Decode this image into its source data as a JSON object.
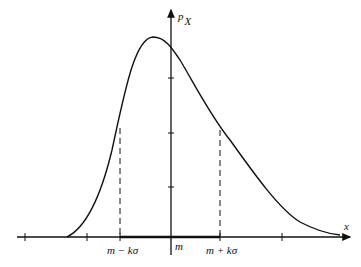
{
  "diagram": {
    "type": "probability-density",
    "y_axis": {
      "label": "p",
      "subscript": "X"
    },
    "x_axis": {
      "label": "x"
    },
    "mean_label": "m",
    "left_bound_label": "m − kσ",
    "right_bound_label": "m + kσ",
    "colors": {
      "stroke": "#111111",
      "background": "#ffffff"
    }
  }
}
